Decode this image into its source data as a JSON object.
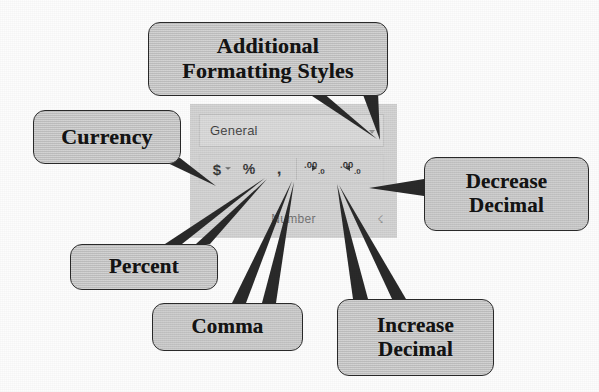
{
  "figure": {
    "background_color": "#fdfdfd",
    "callout_fill": "#c9c9c9",
    "callout_border": "#2a2a2a",
    "ribbon_fill": "#d2d2d2"
  },
  "ribbon": {
    "group_label": "Number",
    "dialog_launcher_icon": "dialog-launcher-icon",
    "number_format": {
      "value": "General",
      "dropdown_icon": "chevron-down-icon"
    },
    "buttons": [
      {
        "name": "currency",
        "glyph": "$",
        "has_dropdown": true,
        "dropdown_icon": "chevron-down-icon"
      },
      {
        "name": "percent",
        "glyph": "%",
        "has_dropdown": false
      },
      {
        "name": "comma",
        "glyph": ",",
        "has_dropdown": false
      },
      {
        "name": "increase-decimal",
        "big": ".00",
        "small": ".0",
        "arrow": "left-arrow-icon",
        "has_dropdown": false
      },
      {
        "name": "decrease-decimal",
        "big": ".00",
        "small": ".0",
        "arrow": "right-arrow-icon",
        "has_dropdown": false
      }
    ]
  },
  "callouts": [
    {
      "id": "additional",
      "line1": "Additional",
      "line2": "Formatting Styles",
      "points_to": "number-format-dropdown",
      "tails": 2
    },
    {
      "id": "currency",
      "line1": "Currency",
      "line2": "",
      "points_to": "currency-button",
      "tails": 1
    },
    {
      "id": "decrease",
      "line1": "Decrease",
      "line2": "Decimal",
      "points_to": "decrease-decimal-button",
      "tails": 1
    },
    {
      "id": "percent",
      "line1": "Percent",
      "line2": "",
      "points_to": "percent-button",
      "tails": 2
    },
    {
      "id": "comma",
      "line1": "Comma",
      "line2": "",
      "points_to": "comma-button",
      "tails": 2
    },
    {
      "id": "increase",
      "line1": "Increase",
      "line2": "Decimal",
      "points_to": "increase-decimal-button",
      "tails": 2
    }
  ]
}
